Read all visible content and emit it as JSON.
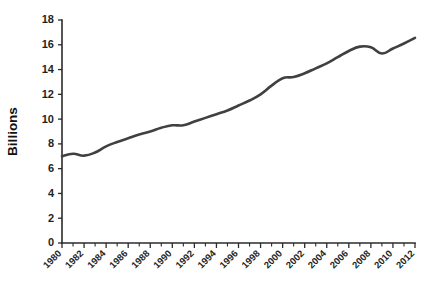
{
  "chart_data": {
    "type": "line",
    "title": "",
    "subtitle": "",
    "xlabel": "",
    "ylabel": "Billions",
    "xlim": [
      1980,
      2012
    ],
    "ylim": [
      0,
      18
    ],
    "grid": false,
    "legend": false,
    "legend_position": "none",
    "line_color": "#404040",
    "axis_color": "#2b2b2b",
    "background_color": "#ffffff",
    "y_ticks": [
      0,
      2,
      4,
      6,
      8,
      10,
      12,
      14,
      16,
      18
    ],
    "y_tick_labels": [
      "0",
      "2",
      "4",
      "6",
      "8",
      "10",
      "12",
      "14",
      "16",
      "18"
    ],
    "x_ticks": [
      1980,
      1981,
      1982,
      1983,
      1984,
      1985,
      1986,
      1987,
      1988,
      1989,
      1990,
      1991,
      1992,
      1993,
      1994,
      1995,
      1996,
      1997,
      1998,
      1999,
      2000,
      2001,
      2002,
      2003,
      2004,
      2005,
      2006,
      2007,
      2008,
      2009,
      2010,
      2011,
      2012
    ],
    "x_tick_labels": [
      "1980",
      "1982",
      "1984",
      "1986",
      "1988",
      "1990",
      "1992",
      "1994",
      "1996",
      "1998",
      "2000",
      "2002",
      "2004",
      "2006",
      "2008",
      "2010",
      "2012"
    ],
    "x_tick_label_years": [
      1980,
      1982,
      1984,
      1986,
      1988,
      1990,
      1992,
      1994,
      1996,
      1998,
      2000,
      2002,
      2004,
      2006,
      2008,
      2010,
      2012
    ],
    "x_tick_label_rotation": -45,
    "series": [
      {
        "name": "Billions",
        "x": [
          1980,
          1981,
          1982,
          1983,
          1984,
          1985,
          1986,
          1987,
          1988,
          1989,
          1990,
          1991,
          1992,
          1993,
          1994,
          1995,
          1996,
          1997,
          1998,
          1999,
          2000,
          2001,
          2002,
          2003,
          2004,
          2005,
          2006,
          2007,
          2008,
          2009,
          2010,
          2011,
          2012
        ],
        "values": [
          7.0,
          7.2,
          7.05,
          7.3,
          7.8,
          8.15,
          8.45,
          8.75,
          9.0,
          9.3,
          9.5,
          9.5,
          9.8,
          10.1,
          10.4,
          10.7,
          11.1,
          11.5,
          12.0,
          12.7,
          13.3,
          13.4,
          13.7,
          14.1,
          14.5,
          15.0,
          15.5,
          15.85,
          15.8,
          15.3,
          15.7,
          16.1,
          16.55
        ]
      }
    ]
  },
  "plot_geometry": {
    "left": 62,
    "right": 415,
    "top": 20,
    "bottom": 243
  }
}
